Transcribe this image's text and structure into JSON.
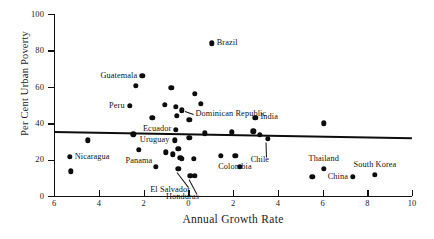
{
  "chart_data": {
    "type": "scatter",
    "title": "",
    "xlabel": "Annual Growth Rate",
    "ylabel": "Per Cent Urban Poverty",
    "xlim": [
      -6,
      10
    ],
    "ylim": [
      0,
      100
    ],
    "xticks": [
      -6,
      -4,
      -2,
      0,
      2,
      4,
      6,
      8,
      10
    ],
    "xtick_labels": [
      "6",
      "4",
      "2",
      "0",
      "2",
      "4",
      "6",
      "8",
      "10"
    ],
    "yticks": [
      0,
      20,
      40,
      60,
      80,
      100
    ],
    "ytick_labels": [
      "0",
      "20",
      "40",
      "60",
      "80",
      "100"
    ],
    "grid": false,
    "legend": "none",
    "marker": "filled-circle",
    "marker_color": "#0d0d0d",
    "trendline": {
      "x_start": -6.0,
      "y_start": 35.5,
      "x_end": 10.0,
      "y_end": 32.0,
      "color": "#0d0d0d"
    },
    "points": [
      {
        "label": "Guatemala",
        "x": -2.05,
        "y": 66.0,
        "label_side": "left"
      },
      {
        "label": "",
        "x": -2.35,
        "y": 60.5
      },
      {
        "label": "",
        "x": -0.75,
        "y": 59.5
      },
      {
        "label": "",
        "x": 0.3,
        "y": 56.0
      },
      {
        "label": "Peru",
        "x": -2.6,
        "y": 49.5,
        "label_side": "left"
      },
      {
        "label": "",
        "x": -1.05,
        "y": 50.0
      },
      {
        "label": "",
        "x": -0.55,
        "y": 49.0
      },
      {
        "label": "",
        "x": -0.5,
        "y": 44.0
      },
      {
        "label": "Dominican Republic",
        "x": -0.3,
        "y": 47.0,
        "label_side": "right-leader"
      },
      {
        "label": "",
        "x": 0.55,
        "y": 50.5
      },
      {
        "label": "",
        "x": -1.6,
        "y": 43.0
      },
      {
        "label": "",
        "x": 0.05,
        "y": 42.0
      },
      {
        "label": "Brazil",
        "x": 1.05,
        "y": 84.0,
        "label_side": "right"
      },
      {
        "label": "India",
        "x": 3.0,
        "y": 43.0,
        "label_side": "right"
      },
      {
        "label": "",
        "x": 6.05,
        "y": 40.0
      },
      {
        "label": "Ecuador",
        "x": -0.55,
        "y": 36.5,
        "label_side": "left"
      },
      {
        "label": "Uruguay",
        "x": -0.6,
        "y": 30.5,
        "label_side": "left"
      },
      {
        "label": "",
        "x": 0.75,
        "y": 34.5
      },
      {
        "label": "",
        "x": 2.9,
        "y": 35.5
      },
      {
        "label": "",
        "x": 3.2,
        "y": 33.5
      },
      {
        "label": "Chile",
        "x": 3.55,
        "y": 31.5,
        "label_side": "below-leader"
      },
      {
        "label": "",
        "x": -4.5,
        "y": 30.5
      },
      {
        "label": "Nicaragua",
        "x": -5.3,
        "y": 21.5,
        "label_side": "right"
      },
      {
        "label": "",
        "x": -5.25,
        "y": 13.5
      },
      {
        "label": "Panama",
        "x": -2.2,
        "y": 25.5,
        "label_side": "below"
      },
      {
        "label": "",
        "x": -1.0,
        "y": 24.0
      },
      {
        "label": "",
        "x": -0.7,
        "y": 23.0
      },
      {
        "label": "",
        "x": -0.45,
        "y": 26.0
      },
      {
        "label": "",
        "x": -0.35,
        "y": 21.0
      },
      {
        "label": "",
        "x": -0.3,
        "y": 20.5
      },
      {
        "label": "",
        "x": 0.25,
        "y": 20.5
      },
      {
        "label": "",
        "x": 1.45,
        "y": 22.0
      },
      {
        "label": "Colombia",
        "x": 2.1,
        "y": 22.0,
        "label_side": "below"
      },
      {
        "label": "",
        "x": 2.3,
        "y": 16.0
      },
      {
        "label": "",
        "x": -1.45,
        "y": 16.0
      },
      {
        "label": "El Salvador",
        "x": -0.45,
        "y": 15.0,
        "label_side": "below-leader"
      },
      {
        "label": "Honduras",
        "x": 0.1,
        "y": 11.0,
        "label_side": "below-leader"
      },
      {
        "label": "",
        "x": 0.3,
        "y": 11.0
      },
      {
        "label": "Thailand",
        "x": 6.05,
        "y": 15.0,
        "label_side": "above"
      },
      {
        "label": "",
        "x": 5.55,
        "y": 10.5
      },
      {
        "label": "China",
        "x": 7.35,
        "y": 10.5,
        "label_side": "left"
      },
      {
        "label": "South Korea",
        "x": 8.35,
        "y": 11.5,
        "label_side": "above"
      },
      {
        "label": "",
        "x": 0.05,
        "y": 32.0
      },
      {
        "label": "",
        "x": -2.45,
        "y": 34.0
      },
      {
        "label": "",
        "x": 1.95,
        "y": 35.0
      }
    ]
  }
}
